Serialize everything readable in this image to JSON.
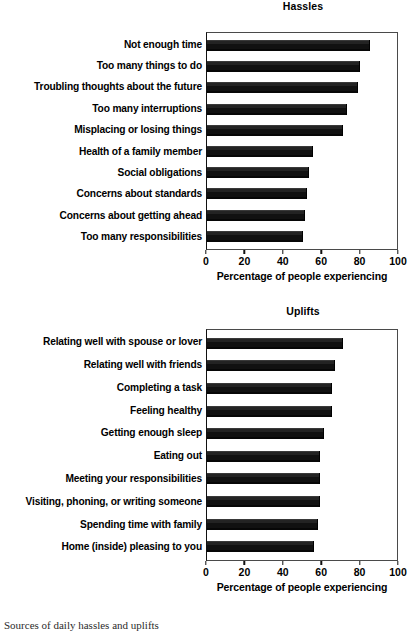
{
  "figure": {
    "caption": "Sources of daily hassles and uplifts"
  },
  "charts": [
    {
      "title": "Hassles",
      "xlabel": "Percentage of people experiencing",
      "ticks": [
        "0",
        "20",
        "40",
        "60",
        "80",
        "100"
      ],
      "categories": [
        "Not enough time",
        "Too many things to do",
        "Troubling thoughts about the future",
        "Too many interruptions",
        "Misplacing or losing things",
        "Health of a family member",
        "Social obligations",
        "Concerns about standards",
        "Concerns about getting ahead",
        "Too many responsibilities"
      ],
      "values": [
        85,
        80,
        79,
        73,
        71,
        55,
        53,
        52,
        51,
        50
      ]
    },
    {
      "title": "Uplifts",
      "xlabel": "Percentage of people experiencing",
      "ticks": [
        "0",
        "20",
        "40",
        "60",
        "80",
        "100"
      ],
      "categories": [
        "Relating well with spouse or lover",
        "Relating well with friends",
        "Completing a task",
        "Feeling healthy",
        "Getting enough sleep",
        "Eating out",
        "Meeting your responsibilities",
        "Visiting, phoning, or writing someone",
        "Spending time with family",
        "Home (inside) pleasing to you"
      ],
      "values": [
        71,
        67,
        65,
        65,
        61,
        59,
        59,
        59,
        58,
        56
      ]
    }
  ],
  "chart_data": [
    {
      "type": "bar",
      "orientation": "horizontal",
      "title": "Hassles",
      "xlabel": "Percentage of people experiencing",
      "ylabel": "",
      "xlim": [
        0,
        100
      ],
      "xticks": [
        0,
        20,
        40,
        60,
        80,
        100
      ],
      "grid": false,
      "legend": "none",
      "bar_color": "#111111",
      "categories": [
        "Not enough time",
        "Too many things to do",
        "Troubling thoughts about the future",
        "Too many interruptions",
        "Misplacing or losing things",
        "Health of a family member",
        "Social obligations",
        "Concerns about standards",
        "Concerns about getting ahead",
        "Too many responsibilities"
      ],
      "values": [
        85,
        80,
        79,
        73,
        71,
        55,
        53,
        52,
        51,
        50
      ]
    },
    {
      "type": "bar",
      "orientation": "horizontal",
      "title": "Uplifts",
      "xlabel": "Percentage of people experiencing",
      "ylabel": "",
      "xlim": [
        0,
        100
      ],
      "xticks": [
        0,
        20,
        40,
        60,
        80,
        100
      ],
      "grid": false,
      "legend": "none",
      "bar_color": "#111111",
      "categories": [
        "Relating well with spouse or lover",
        "Relating well with friends",
        "Completing a task",
        "Feeling healthy",
        "Getting enough sleep",
        "Eating out",
        "Meeting your responsibilities",
        "Visiting, phoning, or writing someone",
        "Spending time with family",
        "Home (inside) pleasing to you"
      ],
      "values": [
        71,
        67,
        65,
        65,
        61,
        59,
        59,
        59,
        58,
        56
      ]
    }
  ]
}
